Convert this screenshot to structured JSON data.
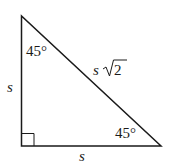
{
  "diagram": {
    "type": "right-triangle-45-45-90",
    "colors": {
      "stroke": "#1a1a1a",
      "background": "#ffffff"
    },
    "angles": {
      "top": "45°",
      "bottom_right": "45°",
      "right_angle_marker": true
    },
    "sides": {
      "left": "s",
      "bottom": "s",
      "hypotenuse_variable": "s",
      "hypotenuse_radicand": "2"
    }
  }
}
